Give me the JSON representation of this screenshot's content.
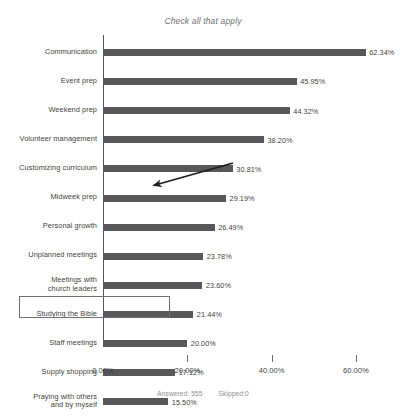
{
  "chart_data": {
    "type": "bar",
    "orientation": "horizontal",
    "title": "Check all that apply",
    "xlabel": "",
    "ylabel": "",
    "xlim": [
      0,
      65
    ],
    "grid": false,
    "legend": null,
    "bar_color": "#58585a",
    "axis_ticks": [
      "0.00%",
      "20.00%",
      "40.00%",
      "60.00%"
    ],
    "axis_tick_values": [
      0,
      20,
      40,
      60
    ],
    "categories": [
      "Communication",
      "Event prep",
      "Weekend prep",
      "Volunteer management",
      "Customizing curriculum",
      "Midweek prep",
      "Personal growth",
      "Unplanned meetings",
      "Meetings with church leaders",
      "Studying the Bible",
      "Staff meetings",
      "Supply shopping",
      "Praying with others and by myself",
      "Recruiting volunteers",
      "Mentoring/discipling kids",
      "Social media",
      "Counseling parents and/or children",
      "Training volunteers",
      "Mentoring/discipling parents",
      "Other",
      "Networking",
      "Training parents",
      ""
    ],
    "values": [
      62.34,
      45.95,
      44.32,
      38.2,
      30.81,
      29.19,
      26.49,
      23.78,
      23.6,
      21.44,
      20.0,
      17.12,
      15.5,
      14.41,
      12.97,
      9.55,
      5.23,
      5.23,
      5.05,
      3.78,
      3.42,
      1.26,
      0.0
    ],
    "value_labels": [
      "62.34%",
      "45.95%",
      "44.32%",
      "38.20%",
      "30.81%",
      "29.19%",
      "26.49%",
      "23.78%",
      "23.60%",
      "21.44%",
      "20.00%",
      "17.12%",
      "15.50%",
      "14.41%",
      "12.97%",
      "9.55%",
      "5.23%",
      "5.23%",
      "5.05%",
      "3.78%",
      "3.42%",
      "1.26%",
      "0.00%"
    ]
  },
  "rows": [
    {
      "label": "Communication",
      "value_label": "62.34%"
    },
    {
      "label": "Event prep",
      "value_label": "45.95%"
    },
    {
      "label": "Weekend prep",
      "value_label": "44.32%"
    },
    {
      "label": "Volunteer management",
      "value_label": "38.20%"
    },
    {
      "label": "Customizing curriculum",
      "value_label": "30.81%"
    },
    {
      "label": "Midweek prep",
      "value_label": "29.19%"
    },
    {
      "label": "Personal growth",
      "value_label": "26.49%"
    },
    {
      "label": "Unplanned meetings",
      "value_label": "23.78%"
    },
    {
      "label": "Meetings with\nchurch leaders",
      "value_label": "23.60%"
    },
    {
      "label": "Studying the Bible",
      "value_label": "21.44%"
    },
    {
      "label": "Staff meetings",
      "value_label": "20.00%"
    },
    {
      "label": "Supply shopping",
      "value_label": "17.12%"
    },
    {
      "label": "Praying with others\nand by myself",
      "value_label": "15.50%"
    },
    {
      "label": "Recruiting volunteers",
      "value_label": "14.41%"
    },
    {
      "label": "Mentoring/discipling\nkids",
      "value_label": "12.97%"
    },
    {
      "label": "Social media",
      "value_label": "9.55%"
    },
    {
      "label": "Counseling parents\nand/or children",
      "value_label": "5.23%"
    },
    {
      "label": "Training volunteers",
      "value_label": "5.23%"
    },
    {
      "label": "Mentoring/discipling\nparents",
      "value_label": "5.05%"
    },
    {
      "label": "Other",
      "value_label": "3.78%"
    },
    {
      "label": "Networking",
      "value_label": "3.42%"
    },
    {
      "label": "Training parents",
      "value_label": "1.26%"
    },
    {
      "label": "",
      "value_label": "0.00%"
    }
  ],
  "annotations": {
    "highlighted_category": "Mentoring/discipling parents",
    "arrow_points_to": "Staff meetings",
    "occluded_label_note": "21.44%"
  },
  "footer": {
    "answered": "Answered: 555",
    "skipped": "Skipped:0"
  }
}
